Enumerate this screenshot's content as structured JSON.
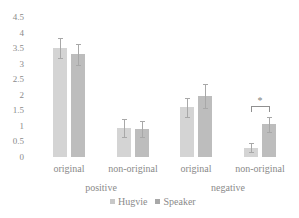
{
  "chart_data": {
    "type": "bar",
    "title": "",
    "xlabel": "",
    "ylabel": "",
    "ylim": [
      0,
      4.5
    ],
    "yticks": [
      "0",
      "0.5",
      "1",
      "1.5",
      "2",
      "2.5",
      "3",
      "3.5",
      "4",
      "4.5"
    ],
    "grid": false,
    "legend_position": "bottom",
    "groups": [
      "positive",
      "negative"
    ],
    "categories": [
      "original",
      "non-original",
      "original",
      "non-original"
    ],
    "category_groups": [
      "positive",
      "positive",
      "negative",
      "negative"
    ],
    "series": [
      {
        "name": "Hugvie",
        "color": "#d4d4d4",
        "values": [
          3.5,
          0.93,
          1.6,
          0.3
        ],
        "error": [
          0.33,
          0.3,
          0.3,
          0.15
        ]
      },
      {
        "name": "Speaker",
        "color": "#bdbdbd",
        "values": [
          3.3,
          0.9,
          1.97,
          1.05
        ],
        "error": [
          0.33,
          0.27,
          0.38,
          0.25
        ]
      }
    ],
    "annotations": [
      {
        "type": "significance",
        "text": "*",
        "between": [
          "Hugvie",
          "Speaker"
        ],
        "category_index": 3
      }
    ]
  },
  "legend": {
    "items": [
      {
        "label": "Hugvie",
        "color": "#d4d4d4"
      },
      {
        "label": "Speaker",
        "color": "#bdbdbd"
      }
    ]
  }
}
